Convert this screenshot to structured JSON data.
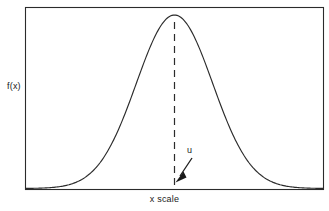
{
  "figure": {
    "type": "statistical-plot",
    "background_color": "#ffffff",
    "line_color": "#1a1a1a"
  },
  "labels": {
    "ylabel": "f(x)",
    "xlabel": "x scale",
    "mean_marker": "u"
  },
  "chart_data": {
    "type": "line",
    "title": "",
    "subtitle": "",
    "xlabel": "x scale",
    "ylabel": "f(x)",
    "grid": false,
    "legend": null,
    "curve_shape": "gaussian",
    "axis_ticks_shown": false,
    "tick_labels": [],
    "xlim": [
      0,
      1
    ],
    "ylim": [
      0,
      1
    ],
    "mean_x_normalized": 0.5,
    "sigma_x_normalized": 0.128,
    "peak_y_normalized": 1.0,
    "annotations": [
      {
        "text": "u",
        "kind": "arrow-label",
        "points_to": "mean on x axis",
        "x_normalized": 0.541,
        "y_normalized": 0.22
      },
      {
        "text": "",
        "kind": "dashed-vertical-line",
        "x_normalized": 0.5,
        "from_y_normalized": 0.0,
        "to_y_normalized": 1.0
      }
    ],
    "x": [
      0.0,
      0.04,
      0.08,
      0.12,
      0.16,
      0.2,
      0.24,
      0.28,
      0.32,
      0.36,
      0.4,
      0.44,
      0.48,
      0.5,
      0.52,
      0.56,
      0.6,
      0.64,
      0.68,
      0.72,
      0.76,
      0.8,
      0.84,
      0.88,
      0.92,
      0.96,
      1.0
    ],
    "y": [
      0.0,
      0.002,
      0.008,
      0.024,
      0.061,
      0.13,
      0.239,
      0.385,
      0.549,
      0.709,
      0.84,
      0.93,
      0.982,
      1.0,
      0.982,
      0.93,
      0.84,
      0.709,
      0.549,
      0.385,
      0.239,
      0.13,
      0.061,
      0.024,
      0.008,
      0.002,
      0.0
    ]
  }
}
